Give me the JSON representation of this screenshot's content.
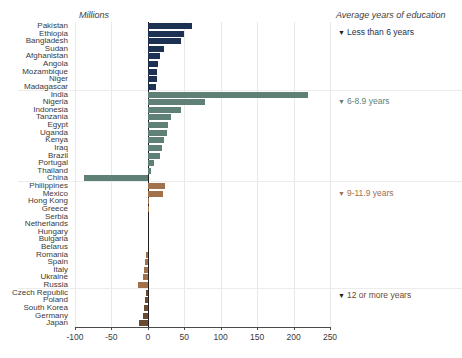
{
  "titles": {
    "left_axis_title": "Millions",
    "right_axis_title": "Average years of education"
  },
  "legend": [
    {
      "label": "Less than 6 years",
      "color": "#1d3252",
      "top": 27
    },
    {
      "label": "6-8.9 years",
      "color": "#5f8077",
      "top": 96
    },
    {
      "label": "9-11.9 years",
      "color": "#a0714a",
      "top": 188
    },
    {
      "label": "12 or more years",
      "color": "#6b4a2e",
      "top": 290
    }
  ],
  "axis": {
    "ticks": [
      -100,
      -50,
      0,
      50,
      100,
      150,
      200,
      250
    ],
    "tick_labels": [
      "-100",
      "-50",
      "0",
      "50",
      "100",
      "150",
      "200",
      "250"
    ],
    "xmin": -100,
    "xmax": 250,
    "grid": true,
    "zero_line": true
  },
  "chart_data": {
    "type": "bar",
    "orientation": "horizontal",
    "title": "",
    "xlabel": "Millions",
    "ylabel": "",
    "xlim": [
      -100,
      250
    ],
    "grid": true,
    "legend_position": "right",
    "legend_title": "Average years of education",
    "groups": [
      {
        "name": "Less than 6 years",
        "color": "#1d3252"
      },
      {
        "name": "6-8.9 years",
        "color": "#5f8077"
      },
      {
        "name": "9-11.9 years",
        "color": "#a0714a"
      },
      {
        "name": "12 or more years",
        "color": "#6b4a2e"
      }
    ],
    "categories": [
      "Pakistan",
      "Ethiopia",
      "Bangladesh",
      "Sudan",
      "Afghanistan",
      "Angola",
      "Mozambique",
      "Niger",
      "Madagascar",
      "India",
      "Nigeria",
      "Indonesia",
      "Tanzania",
      "Egypt",
      "Uganda",
      "Kenya",
      "Iraq",
      "Brazil",
      "Portugal",
      "Thailand",
      "China",
      "Philippines",
      "Mexico",
      "Hong Kong",
      "Greece",
      "Serbia",
      "Netherlands",
      "Hungary",
      "Bulgaria",
      "Belarus",
      "Romania",
      "Spain",
      "Italy",
      "Ukraine",
      "Russia",
      "Czech Republic",
      "Poland",
      "South Korea",
      "Germany",
      "Japan"
    ],
    "values": [
      60,
      49,
      45,
      22,
      17,
      14,
      13,
      12,
      11,
      220,
      78,
      45,
      32,
      28,
      26,
      22,
      20,
      17,
      9,
      5,
      -87,
      24,
      21,
      2,
      1,
      0,
      0,
      0,
      0,
      0,
      -3,
      -4,
      -5,
      -7,
      -14,
      -3,
      -4,
      -5,
      -7,
      -12
    ],
    "bars": [
      {
        "country": "Pakistan",
        "value": 60,
        "group": 0
      },
      {
        "country": "Ethiopia",
        "value": 49,
        "group": 0
      },
      {
        "country": "Bangladesh",
        "value": 45,
        "group": 0
      },
      {
        "country": "Sudan",
        "value": 22,
        "group": 0
      },
      {
        "country": "Afghanistan",
        "value": 17,
        "group": 0
      },
      {
        "country": "Angola",
        "value": 14,
        "group": 0
      },
      {
        "country": "Mozambique",
        "value": 13,
        "group": 0
      },
      {
        "country": "Niger",
        "value": 12,
        "group": 0
      },
      {
        "country": "Madagascar",
        "value": 11,
        "group": 0
      },
      {
        "country": "India",
        "value": 220,
        "group": 1
      },
      {
        "country": "Nigeria",
        "value": 78,
        "group": 1
      },
      {
        "country": "Indonesia",
        "value": 45,
        "group": 1
      },
      {
        "country": "Tanzania",
        "value": 32,
        "group": 1
      },
      {
        "country": "Egypt",
        "value": 28,
        "group": 1
      },
      {
        "country": "Uganda",
        "value": 26,
        "group": 1
      },
      {
        "country": "Kenya",
        "value": 22,
        "group": 1
      },
      {
        "country": "Iraq",
        "value": 20,
        "group": 1
      },
      {
        "country": "Brazil",
        "value": 17,
        "group": 1
      },
      {
        "country": "Portugal",
        "value": 9,
        "group": 1
      },
      {
        "country": "Thailand",
        "value": 5,
        "group": 1
      },
      {
        "country": "China",
        "value": -87,
        "group": 1
      },
      {
        "country": "Philippines",
        "value": 24,
        "group": 2
      },
      {
        "country": "Mexico",
        "value": 21,
        "group": 2
      },
      {
        "country": "Hong Kong",
        "value": 2,
        "group": 2
      },
      {
        "country": "Greece",
        "value": 1,
        "group": 2
      },
      {
        "country": "Serbia",
        "value": 0,
        "group": 2
      },
      {
        "country": "Netherlands",
        "value": 0,
        "group": 2
      },
      {
        "country": "Hungary",
        "value": 0,
        "group": 2
      },
      {
        "country": "Bulgaria",
        "value": 0,
        "group": 2
      },
      {
        "country": "Belarus",
        "value": 0,
        "group": 2
      },
      {
        "country": "Romania",
        "value": -3,
        "group": 2
      },
      {
        "country": "Spain",
        "value": -4,
        "group": 2
      },
      {
        "country": "Italy",
        "value": -5,
        "group": 2
      },
      {
        "country": "Ukraine",
        "value": -7,
        "group": 2
      },
      {
        "country": "Russia",
        "value": -14,
        "group": 2
      },
      {
        "country": "Czech Republic",
        "value": -3,
        "group": 3
      },
      {
        "country": "Poland",
        "value": -4,
        "group": 3
      },
      {
        "country": "South Korea",
        "value": -5,
        "group": 3
      },
      {
        "country": "Germany",
        "value": -7,
        "group": 3
      },
      {
        "country": "Japan",
        "value": -12,
        "group": 3
      }
    ]
  }
}
